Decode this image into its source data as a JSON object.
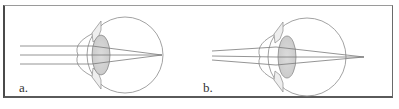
{
  "figure": {
    "colors": {
      "line": "#8a8a8a",
      "lens_fill": "#d4d4d4",
      "border": "#555555",
      "text": "#333333"
    },
    "panels": [
      {
        "label": "a.",
        "rays": "parallel",
        "focus": "on-retina"
      },
      {
        "label": "b.",
        "rays": "diverging",
        "focus": "on-retina"
      }
    ]
  }
}
